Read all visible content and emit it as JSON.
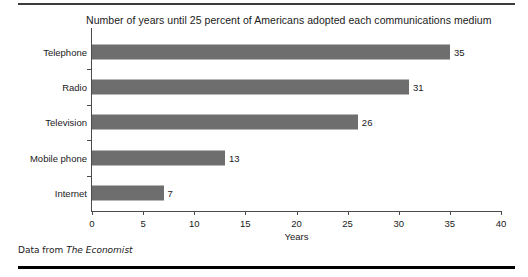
{
  "rules": {
    "top": "horizontal-rule",
    "bottom": "horizontal-rule"
  },
  "source": {
    "prefix": "Data from ",
    "publication": "The Economist"
  },
  "chart_data": {
    "type": "bar",
    "orientation": "horizontal",
    "title": "Number of years until 25 percent of Americans adopted each communications medium",
    "xlabel": "Years",
    "ylabel": "",
    "categories": [
      "Telephone",
      "Radio",
      "Television",
      "Mobile phone",
      "Internet"
    ],
    "values": [
      35,
      31,
      26,
      13,
      7
    ],
    "value_labels": [
      "35",
      "31",
      "26",
      "13",
      "7"
    ],
    "xlim": [
      0,
      40
    ],
    "xticks": [
      0,
      5,
      10,
      15,
      20,
      25,
      30,
      35,
      40
    ],
    "xtick_labels": [
      "0",
      "5",
      "10",
      "15",
      "20",
      "25",
      "30",
      "35",
      "40"
    ],
    "grid": false,
    "legend": false,
    "bar_color": "#6e6e6e",
    "axis_color": "#4a4a4a",
    "text_color": "#1a1a1a"
  }
}
